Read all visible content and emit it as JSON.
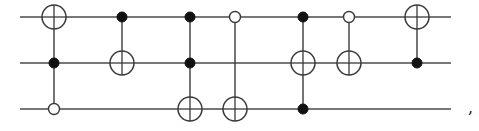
{
  "diagram": {
    "type": "quantum-circuit",
    "qubits": 3,
    "wire_y": [
      17,
      63,
      109
    ],
    "wire_x_start": 20,
    "wire_x_end": 451,
    "target_radius": 12,
    "filled_control_radius": 5,
    "open_control_radius": 5.5,
    "gates": [
      {
        "x": 54,
        "target": 0,
        "controls": [
          {
            "qubit": 1,
            "type": "filled"
          },
          {
            "qubit": 2,
            "type": "open"
          }
        ]
      },
      {
        "x": 122,
        "target": 1,
        "controls": [
          {
            "qubit": 0,
            "type": "filled"
          }
        ]
      },
      {
        "x": 190,
        "target": 2,
        "controls": [
          {
            "qubit": 0,
            "type": "filled"
          },
          {
            "qubit": 1,
            "type": "filled"
          }
        ]
      },
      {
        "x": 235,
        "target": 2,
        "controls": [
          {
            "qubit": 0,
            "type": "open"
          }
        ]
      },
      {
        "x": 303,
        "target": 1,
        "controls": [
          {
            "qubit": 0,
            "type": "filled"
          },
          {
            "qubit": 2,
            "type": "filled"
          }
        ]
      },
      {
        "x": 349,
        "target": 1,
        "controls": [
          {
            "qubit": 0,
            "type": "open"
          }
        ]
      },
      {
        "x": 417,
        "target": 0,
        "controls": [
          {
            "qubit": 1,
            "type": "filled"
          }
        ]
      }
    ],
    "trailing_punctuation": ","
  }
}
